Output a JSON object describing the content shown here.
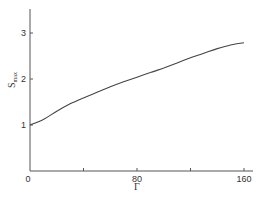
{
  "chart_data": {
    "type": "line",
    "title": "",
    "xlabel": "Γ",
    "ylabel": "S",
    "ylabel_subscript": "max",
    "xlim": [
      0,
      160
    ],
    "ylim": [
      0,
      3.5
    ],
    "x_ticks": [
      0,
      40,
      80,
      120,
      160
    ],
    "x_tick_labels": [
      "0",
      "",
      "80",
      "",
      "160"
    ],
    "y_ticks": [
      1,
      2,
      3
    ],
    "y_tick_labels": [
      "1",
      "2",
      "3"
    ],
    "grid": false,
    "legend": null,
    "series": [
      {
        "name": "S_max",
        "x": [
          0,
          10,
          20,
          30,
          40,
          50,
          60,
          70,
          80,
          90,
          100,
          110,
          120,
          130,
          140,
          150,
          160
        ],
        "values": [
          1.0,
          1.12,
          1.3,
          1.46,
          1.59,
          1.71,
          1.83,
          1.94,
          2.04,
          2.14,
          2.24,
          2.35,
          2.46,
          2.56,
          2.66,
          2.74,
          2.79
        ]
      }
    ],
    "colors": {
      "line": "#444444",
      "axis": "#555555",
      "text": "#333333"
    }
  }
}
